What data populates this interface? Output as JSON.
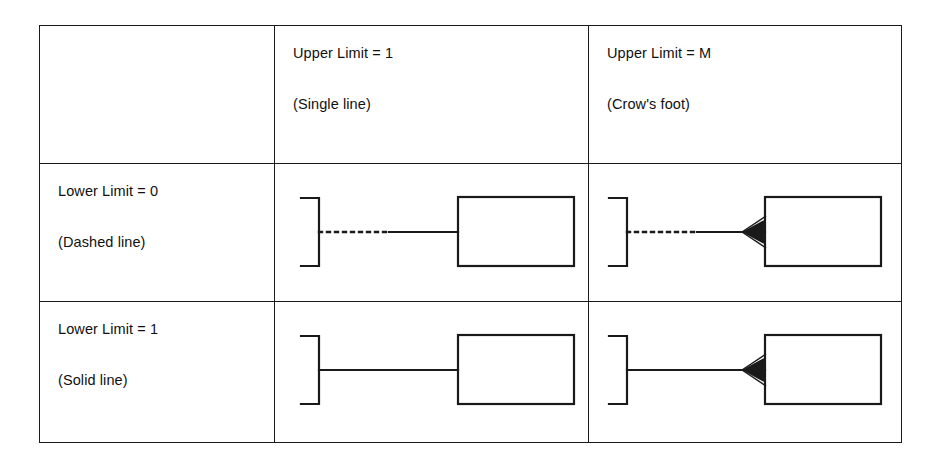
{
  "figure": {
    "type": "notation-matrix",
    "background_color": "#ffffff",
    "ink_color": "#1a1a1a"
  },
  "table": {
    "column_headers": [
      {
        "id": "corner",
        "line1": "",
        "line2": ""
      },
      {
        "id": "upper-limit-1",
        "line1": "Upper Limit = 1",
        "line2": "(Single line)"
      },
      {
        "id": "upper-limit-m",
        "line1": "Upper Limit = M",
        "line2": "(Crow's foot)"
      }
    ],
    "row_headers": [
      {
        "id": "lower-limit-0",
        "line1": "Lower Limit = 0",
        "line2": "(Dashed line)"
      },
      {
        "id": "lower-limit-1",
        "line1": "Lower Limit = 1",
        "line2": "(Solid line)"
      }
    ],
    "cells": [
      {
        "row": "lower-limit-0",
        "column": "upper-limit-1",
        "connector": {
          "left_half": "dashed",
          "right_half": "solid",
          "end_marker": "none",
          "left_shape": "bracket",
          "right_shape": "rectangle"
        }
      },
      {
        "row": "lower-limit-0",
        "column": "upper-limit-m",
        "connector": {
          "left_half": "dashed",
          "right_half": "solid",
          "end_marker": "crows-foot",
          "left_shape": "bracket",
          "right_shape": "rectangle"
        }
      },
      {
        "row": "lower-limit-1",
        "column": "upper-limit-1",
        "connector": {
          "left_half": "solid",
          "right_half": "solid",
          "end_marker": "none",
          "left_shape": "bracket",
          "right_shape": "rectangle"
        }
      },
      {
        "row": "lower-limit-1",
        "column": "upper-limit-m",
        "connector": {
          "left_half": "solid",
          "right_half": "solid",
          "end_marker": "crows-foot",
          "left_shape": "bracket",
          "right_shape": "rectangle"
        }
      }
    ]
  }
}
